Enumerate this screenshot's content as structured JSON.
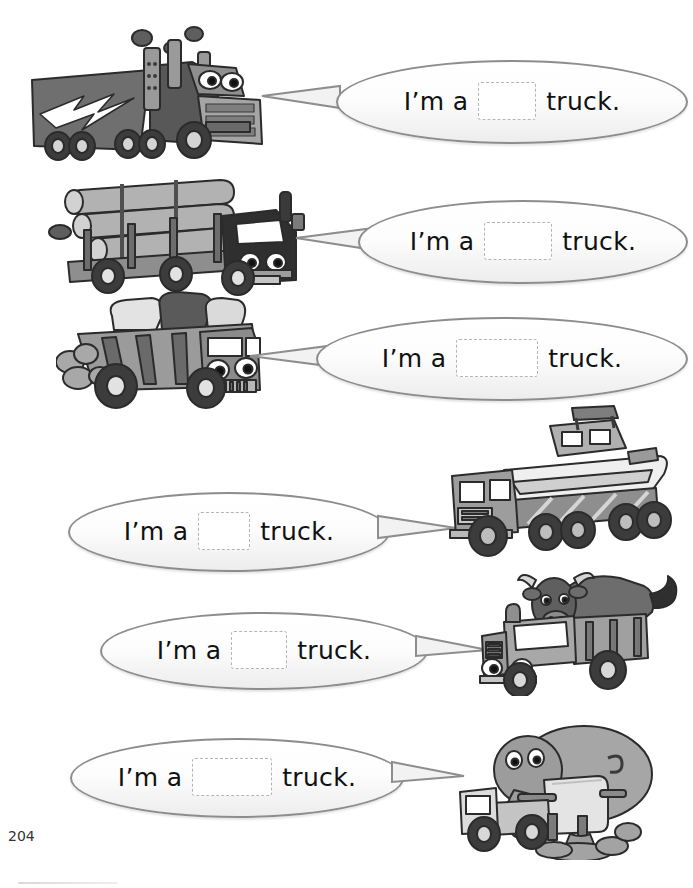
{
  "page": {
    "number": "204",
    "worksheet_type": "fill-in-the-blank vehicle naming worksheet"
  },
  "colors": {
    "bubble_border": "#8d8d8d",
    "bubble_fill": "#ffffff",
    "blank_border": "#b4b4b4",
    "text": "#111111",
    "art_dark": "#4a4a4a",
    "art_mid": "#8a8a8a",
    "art_light": "#c9c9c9"
  },
  "sentence": {
    "prefix": "I’m a",
    "suffix": "truck."
  },
  "items": [
    {
      "index": 1,
      "bubble_side": "right",
      "truck_side": "left",
      "blank_width": 56,
      "sentence_prefix": "I’m a",
      "sentence_suffix": "truck.",
      "answer_blank": "",
      "illustration": "semi-trailer-truck-with-lightning-bolt"
    },
    {
      "index": 2,
      "bubble_side": "right",
      "truck_side": "left",
      "blank_width": 66,
      "sentence_prefix": "I’m a",
      "sentence_suffix": "truck.",
      "answer_blank": "",
      "illustration": "logging-truck-carrying-logs"
    },
    {
      "index": 3,
      "bubble_side": "right",
      "truck_side": "left",
      "blank_width": 80,
      "sentence_prefix": "I’m a",
      "sentence_suffix": "truck.",
      "answer_blank": "",
      "illustration": "dump-truck-with-rocks"
    },
    {
      "index": 4,
      "bubble_side": "left",
      "truck_side": "right",
      "blank_width": 50,
      "sentence_prefix": "I’m a",
      "sentence_suffix": "truck.",
      "answer_blank": "",
      "illustration": "flatbed-truck-carrying-boat"
    },
    {
      "index": 5,
      "bubble_side": "left",
      "truck_side": "right",
      "blank_width": 54,
      "sentence_prefix": "I’m a",
      "sentence_suffix": "truck.",
      "answer_blank": "",
      "illustration": "cattle-truck-with-bull"
    },
    {
      "index": 6,
      "bubble_side": "left",
      "truck_side": "right",
      "blank_width": 78,
      "sentence_prefix": "I’m a",
      "sentence_suffix": "truck.",
      "answer_blank": "",
      "illustration": "cement-mixer-truck-with-elephant"
    }
  ]
}
